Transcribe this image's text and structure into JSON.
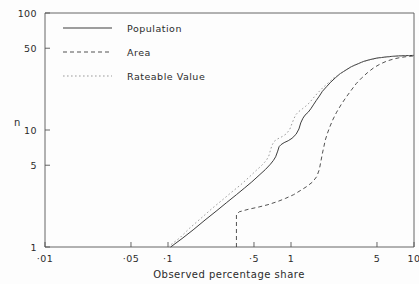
{
  "chart_data": {
    "type": "line",
    "title": "",
    "subtitle": "",
    "xlabel": "Observed percentage share",
    "ylabel": "n",
    "xscale": "log",
    "yscale": "log",
    "xlim": [
      0.01,
      10
    ],
    "ylim": [
      1,
      100
    ],
    "grid": false,
    "legend_position": "top-left-inside",
    "xticks": [
      {
        "value": 0.01,
        "label": "·01"
      },
      {
        "value": 0.05,
        "label": "·05"
      },
      {
        "value": 0.1,
        "label": "·1"
      },
      {
        "value": 0.5,
        "label": "·5"
      },
      {
        "value": 1,
        "label": "1"
      },
      {
        "value": 5,
        "label": "5"
      },
      {
        "value": 10,
        "label": "10"
      }
    ],
    "yticks": [
      {
        "value": 1,
        "label": "1"
      },
      {
        "value": 5,
        "label": "5"
      },
      {
        "value": 10,
        "label": "10"
      },
      {
        "value": 50,
        "label": "50"
      },
      {
        "value": 100,
        "label": "100"
      }
    ],
    "series": [
      {
        "name": "Population",
        "style": "solid",
        "color": "#333333",
        "points": [
          [
            0.105,
            1.0
          ],
          [
            0.13,
            1.18
          ],
          [
            0.16,
            1.4
          ],
          [
            0.2,
            1.7
          ],
          [
            0.25,
            2.05
          ],
          [
            0.3,
            2.4
          ],
          [
            0.36,
            2.8
          ],
          [
            0.42,
            3.2
          ],
          [
            0.48,
            3.6
          ],
          [
            0.55,
            4.1
          ],
          [
            0.62,
            4.6
          ],
          [
            0.68,
            5.1
          ],
          [
            0.72,
            5.5
          ],
          [
            0.75,
            5.9
          ],
          [
            0.78,
            6.6
          ],
          [
            0.8,
            7.2
          ],
          [
            0.83,
            7.5
          ],
          [
            0.88,
            7.8
          ],
          [
            0.95,
            8.1
          ],
          [
            1.02,
            8.5
          ],
          [
            1.1,
            9.2
          ],
          [
            1.16,
            10.2
          ],
          [
            1.2,
            11.5
          ],
          [
            1.25,
            12.6
          ],
          [
            1.3,
            13.4
          ],
          [
            1.38,
            14.2
          ],
          [
            1.45,
            15.2
          ],
          [
            1.52,
            16.4
          ],
          [
            1.6,
            17.8
          ],
          [
            1.7,
            19.5
          ],
          [
            1.8,
            21.4
          ],
          [
            1.95,
            23.5
          ],
          [
            2.1,
            25.6
          ],
          [
            2.3,
            28.0
          ],
          [
            2.5,
            30.2
          ],
          [
            2.8,
            32.6
          ],
          [
            3.1,
            34.8
          ],
          [
            3.5,
            36.8
          ],
          [
            3.9,
            38.6
          ],
          [
            4.4,
            40.0
          ],
          [
            5.0,
            41.2
          ],
          [
            5.8,
            42.0
          ],
          [
            6.6,
            42.6
          ],
          [
            7.5,
            43.0
          ],
          [
            8.5,
            43.2
          ],
          [
            10.0,
            43.4
          ]
        ]
      },
      {
        "name": "Area",
        "style": "dashed",
        "color": "#333333",
        "points": [
          [
            0.36,
            1.0
          ],
          [
            0.36,
            1.9
          ],
          [
            0.38,
            2.0
          ],
          [
            0.45,
            2.1
          ],
          [
            0.55,
            2.2
          ],
          [
            0.65,
            2.3
          ],
          [
            0.78,
            2.45
          ],
          [
            0.9,
            2.6
          ],
          [
            1.05,
            2.8
          ],
          [
            1.2,
            3.05
          ],
          [
            1.35,
            3.3
          ],
          [
            1.5,
            3.6
          ],
          [
            1.62,
            4.0
          ],
          [
            1.7,
            4.6
          ],
          [
            1.75,
            5.4
          ],
          [
            1.8,
            6.3
          ],
          [
            1.85,
            7.2
          ],
          [
            1.9,
            8.2
          ],
          [
            1.98,
            9.4
          ],
          [
            2.08,
            10.8
          ],
          [
            2.2,
            12.4
          ],
          [
            2.35,
            14.2
          ],
          [
            2.55,
            16.4
          ],
          [
            2.8,
            19.0
          ],
          [
            3.1,
            22.0
          ],
          [
            3.4,
            25.0
          ],
          [
            3.8,
            28.2
          ],
          [
            4.2,
            31.0
          ],
          [
            4.7,
            34.0
          ],
          [
            5.3,
            36.6
          ],
          [
            6.0,
            38.8
          ],
          [
            6.8,
            40.4
          ],
          [
            7.7,
            41.6
          ],
          [
            8.7,
            42.4
          ],
          [
            10.0,
            43.0
          ]
        ]
      },
      {
        "name": "Rateable Value",
        "style": "dotted",
        "color": "#8a8a8a",
        "points": [
          [
            0.1,
            1.0
          ],
          [
            0.125,
            1.2
          ],
          [
            0.15,
            1.45
          ],
          [
            0.19,
            1.8
          ],
          [
            0.23,
            2.15
          ],
          [
            0.28,
            2.55
          ],
          [
            0.33,
            2.95
          ],
          [
            0.39,
            3.4
          ],
          [
            0.45,
            3.9
          ],
          [
            0.52,
            4.5
          ],
          [
            0.58,
            5.0
          ],
          [
            0.63,
            5.5
          ],
          [
            0.66,
            6.0
          ],
          [
            0.68,
            6.7
          ],
          [
            0.7,
            7.4
          ],
          [
            0.73,
            8.0
          ],
          [
            0.78,
            8.4
          ],
          [
            0.85,
            8.8
          ],
          [
            0.92,
            9.3
          ],
          [
            0.98,
            10.2
          ],
          [
            1.02,
            11.4
          ],
          [
            1.06,
            12.6
          ],
          [
            1.1,
            13.6
          ],
          [
            1.16,
            14.4
          ],
          [
            1.24,
            15.2
          ],
          [
            1.32,
            16.0
          ],
          [
            1.42,
            17.2
          ],
          [
            1.52,
            18.8
          ],
          [
            1.64,
            20.6
          ],
          [
            1.8,
            22.8
          ],
          [
            2.0,
            25.2
          ],
          [
            2.2,
            27.6
          ],
          [
            2.5,
            30.2
          ],
          [
            2.85,
            33.0
          ],
          [
            3.2,
            35.4
          ],
          [
            3.7,
            37.6
          ],
          [
            4.2,
            39.4
          ],
          [
            4.9,
            40.8
          ],
          [
            5.6,
            41.8
          ],
          [
            6.5,
            42.4
          ],
          [
            7.6,
            42.9
          ],
          [
            8.8,
            43.2
          ],
          [
            10.0,
            43.4
          ]
        ]
      }
    ]
  },
  "legend": {
    "items": [
      {
        "label": "Population"
      },
      {
        "label": "Area"
      },
      {
        "label": "Rateable Value"
      }
    ]
  },
  "axes": {
    "x_title": "Observed percentage share",
    "y_title": "n"
  }
}
